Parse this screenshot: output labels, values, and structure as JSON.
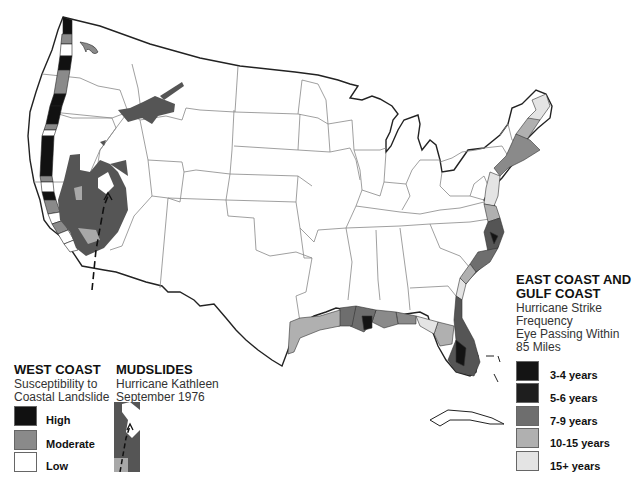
{
  "west_coast_legend": {
    "title": "WEST COAST",
    "subtitle_line1": "Susceptibility to",
    "subtitle_line2": "Coastal Landslide",
    "items": [
      {
        "label": "High",
        "color": "#111111"
      },
      {
        "label": "Moderate",
        "color": "#8a8a8a"
      },
      {
        "label": "Low",
        "color": "#ffffff"
      }
    ]
  },
  "mudslides_legend": {
    "title": "MUDSLIDES",
    "subtitle_line1": "Hurricane Kathleen",
    "subtitle_line2": "September 1976"
  },
  "east_coast_legend": {
    "title_line1": "EAST COAST AND",
    "title_line2": "GULF COAST",
    "subtitle_line1": "Hurricane Strike",
    "subtitle_line2": "Frequency",
    "subtitle_line3": "Eye Passing Within",
    "subtitle_line4": "85 Miles",
    "items": [
      {
        "label": "3-4 years",
        "color": "#141414"
      },
      {
        "label": "5-6 years",
        "color": "#1e1e1e"
      },
      {
        "label": "7-9 years",
        "color": "#6e6e6e"
      },
      {
        "label": "10-15 years",
        "color": "#b0b0b0"
      },
      {
        "label": "15+ years",
        "color": "#e4e4e4"
      }
    ]
  },
  "colors": {
    "state_line": "#777777",
    "coast_line": "#222222",
    "mudslide_fill": "#555555",
    "mudslide_light": "#a8a8a8"
  }
}
